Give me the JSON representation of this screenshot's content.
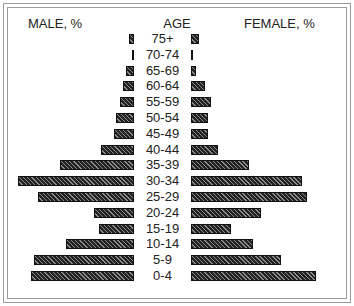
{
  "chart_data": {
    "type": "bar",
    "subtype": "population-pyramid",
    "title": "",
    "left_label": "MALE, %",
    "center_label": "AGE",
    "right_label": "FEMALE, %",
    "categories": [
      "75+",
      "70-74",
      "65-69",
      "60-64",
      "55-59",
      "50-54",
      "45-49",
      "40-44",
      "35-39",
      "30-34",
      "25-29",
      "20-24",
      "15-19",
      "10-14",
      "5-9",
      "0-4"
    ],
    "series": [
      {
        "name": "MALE, %",
        "side": "left",
        "values": [
          0.3,
          0.1,
          0.5,
          0.7,
          0.9,
          1.2,
          1.3,
          2.2,
          4.9,
          7.6,
          6.3,
          2.6,
          2.3,
          4.5,
          6.6,
          6.8
        ]
      },
      {
        "name": "FEMALE, %",
        "side": "right",
        "values": [
          0.5,
          0.1,
          0.3,
          0.9,
          1.3,
          1.1,
          1.1,
          1.8,
          3.8,
          7.3,
          7.6,
          4.6,
          2.6,
          4.1,
          5.9,
          8.2
        ]
      }
    ],
    "px_per_unit": 15.2,
    "axis_ticks": "none shown",
    "grid": false,
    "legend": "text labels at top (MALE, % left; FEMALE, % right)"
  },
  "colors": {
    "bar_fill": "#222222",
    "bar_hatch": "#8a8a8a",
    "frame": "#9a9a9a",
    "background": "#ffffff"
  }
}
